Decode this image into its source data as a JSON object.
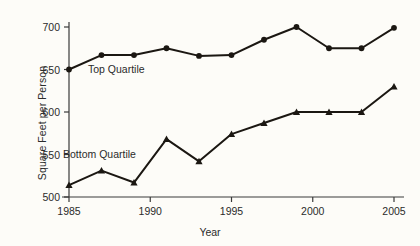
{
  "chart_data": {
    "type": "line",
    "title": "",
    "xlabel": "Year",
    "ylabel": "Square Feet per Person",
    "xlim": [
      1985,
      2005
    ],
    "ylim": [
      500,
      700
    ],
    "grid": false,
    "legend_position": "inline-annotation",
    "xticks": [
      1985,
      1990,
      1995,
      2000,
      2005
    ],
    "yticks": [
      500,
      550,
      600,
      650,
      700
    ],
    "series": [
      {
        "name": "Top Quartile",
        "marker": "circle",
        "color": "#1b1712",
        "annotation": "Top Quartile",
        "x": [
          1985,
          1987,
          1989,
          1991,
          1993,
          1995,
          1997,
          1999,
          2001,
          2003,
          2005
        ],
        "values": [
          650,
          667,
          667,
          675,
          666,
          667,
          685,
          700,
          675,
          675,
          699
        ]
      },
      {
        "name": "Bottom Quartile",
        "marker": "triangle",
        "color": "#1b1712",
        "annotation": "Bottom Quartile",
        "x": [
          1985,
          1987,
          1989,
          1991,
          1993,
          1995,
          1997,
          1999,
          2001,
          2003,
          2005
        ],
        "values": [
          514,
          531,
          517,
          568,
          542,
          574,
          587,
          600,
          600,
          600,
          630
        ]
      }
    ]
  },
  "axis": {
    "ylabel_text": "Square Feet per Person",
    "xlabel_text": "Year",
    "ytick_labels": [
      "700",
      "650",
      "600",
      "550",
      "500"
    ],
    "xtick_labels": [
      "1985",
      "1990",
      "1995",
      "2000",
      "2005"
    ]
  },
  "annotations": {
    "top": "Top Quartile",
    "bottom": "Bottom Quartile"
  },
  "colors": {
    "line": "#1b1712",
    "axis": "#3a3a3a",
    "text": "#2b2b2b",
    "background": "#fdfcf8"
  }
}
